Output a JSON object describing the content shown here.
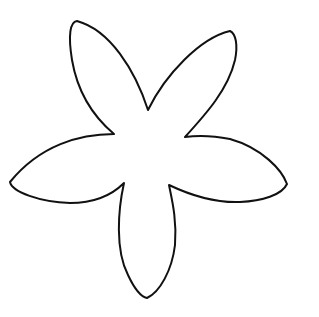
{
  "image": {
    "subject": "Five-petal flower outline",
    "background_color": "#ffffff",
    "stroke_color": "#111111",
    "petal_count": 5
  }
}
